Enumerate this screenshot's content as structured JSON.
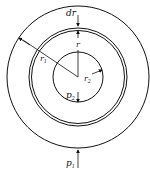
{
  "diagram": {
    "labels": {
      "dr": "dr",
      "r": "r",
      "r1": "r",
      "r1_sub": "1",
      "r2": "r",
      "r2_sub": "2",
      "p2": "p",
      "p2_sub": "2",
      "p1": "p",
      "p1_sub": "1"
    },
    "colors": {
      "stroke": "#111111",
      "background": "#ffffff"
    }
  }
}
